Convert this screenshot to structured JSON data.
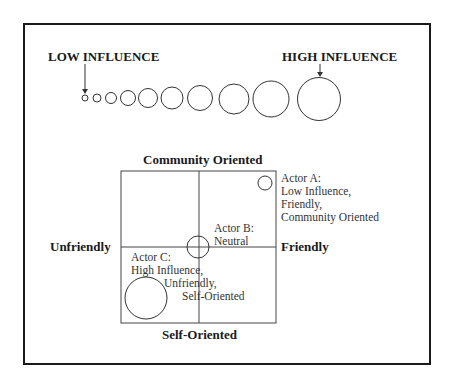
{
  "scale": {
    "low_label": "LOW INFLUENCE",
    "high_label": "HIGH INFLUENCE",
    "circles": [
      {
        "cx": 85,
        "cy": 98,
        "r": 3
      },
      {
        "cx": 97,
        "cy": 98,
        "r": 4
      },
      {
        "cx": 111,
        "cy": 98,
        "r": 5.5
      },
      {
        "cx": 128,
        "cy": 98,
        "r": 7.5
      },
      {
        "cx": 148,
        "cy": 98,
        "r": 9.5
      },
      {
        "cx": 172,
        "cy": 98,
        "r": 11
      },
      {
        "cx": 200,
        "cy": 98,
        "r": 12.5
      },
      {
        "cx": 234,
        "cy": 99,
        "r": 15
      },
      {
        "cx": 271,
        "cy": 99,
        "r": 18
      },
      {
        "cx": 319,
        "cy": 99,
        "r": 21.5
      }
    ]
  },
  "quadrant": {
    "top_label": "Community Oriented",
    "bottom_label": "Self-Oriented",
    "left_label": "Unfriendly",
    "right_label": "Friendly",
    "actors": [
      {
        "name": "Actor A",
        "lines": [
          "Actor A:",
          "Low Influence,",
          "Friendly,",
          "Community Oriented"
        ],
        "cx": 265,
        "cy": 183,
        "r": 7
      },
      {
        "name": "Actor B",
        "lines": [
          "Actor B:",
          "Neutral"
        ],
        "cx": 198,
        "cy": 247,
        "r": 11
      },
      {
        "name": "Actor C",
        "lines": [
          "Actor C:",
          "High Influence,",
          "Unfriendly,",
          "Self-Oriented"
        ],
        "cx": 146,
        "cy": 298,
        "r": 21
      }
    ]
  }
}
